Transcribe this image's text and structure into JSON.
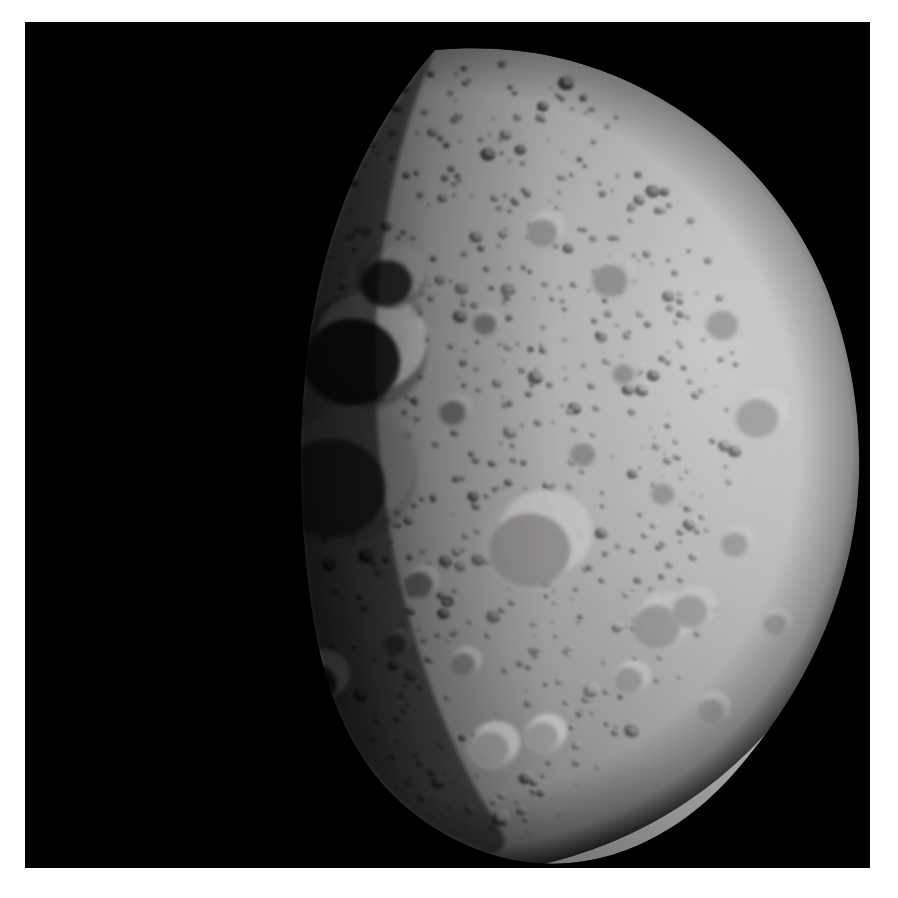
{
  "image": {
    "subject_name": "4 Vesta",
    "subject_type": "asteroid",
    "view": "half-lit disc, terminator on left, illuminated limb on right",
    "palette": {
      "page_background": "#ffffff",
      "space_background": "#000000",
      "limb_highlight": "#eceaea",
      "sunlit_regolith": "#c9c7c6",
      "midtone_regolith": "#9e9c9b",
      "terminator_dim": "#4a4847",
      "shadow": "#070707",
      "crater_floor_dark": "#5d5b5a",
      "crater_rim_bright": "#e2e0df"
    },
    "frame": {
      "x": 25,
      "y": 22,
      "width": 845,
      "height": 846
    }
  },
  "body_shape": {
    "comment": "Outline of the asteroid disc in frame-local coordinates (845x846 viewBox).",
    "outline_path": "M 410 28 C 500 20 580 40 650 85 C 720 130 775 195 805 275 C 828 338 836 400 834 455 C 832 510 820 560 800 608 C 778 660 748 706 712 748 C 676 790 634 818 590 832 C 548 845 505 845 465 832 C 428 820 396 800 370 775 C 346 752 330 726 318 700 C 300 660 290 616 284 568 C 276 505 274 440 278 378 C 282 312 294 248 316 188 C 336 134 368 76 410 28 Z",
    "terminator_path": "M 410 28 C 392 70 376 118 366 170 C 352 244 348 320 352 396 C 356 470 368 542 388 610 C 404 666 426 722 454 772 C 474 808 494 824 465 832 C 428 820 396 800 370 775 C 346 752 330 726 318 700 C 300 660 290 616 284 568 C 276 505 274 440 278 378 C 282 312 294 248 316 188 C 336 134 368 76 410 28 Z"
  },
  "lighting": {
    "sun_direction": "from upper right",
    "terminator_x_fraction": 0.42,
    "limb_brightness": 0.93,
    "shadow_darkness": 0.03
  },
  "craters": [
    {
      "cx": 512,
      "cy": 520,
      "r": 46,
      "tone": 0.7,
      "rim": 0.95,
      "name": "central-large-crater"
    },
    {
      "cx": 336,
      "cy": 330,
      "r": 54,
      "tone": 0.05,
      "rim": 1.0,
      "name": "bright-rim-shadow-crater"
    },
    {
      "cx": 316,
      "cy": 455,
      "r": 62,
      "tone": 0.22,
      "rim": 0.5,
      "name": "terminator-basin"
    },
    {
      "cx": 366,
      "cy": 256,
      "r": 29,
      "tone": 0.14,
      "rim": 0.72,
      "name": "upper-left-crater"
    },
    {
      "cx": 292,
      "cy": 658,
      "r": 27,
      "tone": 0.06,
      "rim": 0.96,
      "name": "crescent-rim-crater"
    },
    {
      "cx": 636,
      "cy": 600,
      "r": 27,
      "tone": 0.74,
      "rim": 0.92,
      "name": "right-paired-crater-a"
    },
    {
      "cx": 668,
      "cy": 586,
      "r": 20,
      "tone": 0.76,
      "rim": 0.9,
      "name": "right-paired-crater-b"
    },
    {
      "cx": 736,
      "cy": 392,
      "r": 24,
      "tone": 0.78,
      "rim": 0.94,
      "name": "right-limb-crater"
    },
    {
      "cx": 700,
      "cy": 300,
      "r": 18,
      "tone": 0.76,
      "rim": 0.92,
      "name": "upper-right-crater"
    },
    {
      "cx": 588,
      "cy": 255,
      "r": 20,
      "tone": 0.72,
      "rim": 0.9,
      "name": "north-crater-a"
    },
    {
      "cx": 520,
      "cy": 208,
      "r": 17,
      "tone": 0.7,
      "rim": 0.9,
      "name": "north-crater-b"
    },
    {
      "cx": 468,
      "cy": 724,
      "r": 22,
      "tone": 0.76,
      "rim": 0.93,
      "name": "south-crater-a"
    },
    {
      "cx": 520,
      "cy": 712,
      "r": 18,
      "tone": 0.78,
      "rim": 0.94,
      "name": "south-crater-b"
    },
    {
      "cx": 606,
      "cy": 656,
      "r": 16,
      "tone": 0.74,
      "rim": 0.9,
      "name": "south-crater-c"
    },
    {
      "cx": 688,
      "cy": 686,
      "r": 15,
      "tone": 0.72,
      "rim": 0.88,
      "name": "south-crater-d"
    },
    {
      "cx": 430,
      "cy": 388,
      "r": 15,
      "tone": 0.48,
      "rim": 0.8,
      "name": "mid-crater-a"
    },
    {
      "cx": 462,
      "cy": 300,
      "r": 13,
      "tone": 0.52,
      "rim": 0.82,
      "name": "mid-crater-b"
    },
    {
      "cx": 560,
      "cy": 430,
      "r": 14,
      "tone": 0.66,
      "rim": 0.86,
      "name": "mid-crater-c"
    },
    {
      "cx": 640,
      "cy": 470,
      "r": 13,
      "tone": 0.7,
      "rim": 0.88,
      "name": "mid-crater-d"
    },
    {
      "cx": 712,
      "cy": 520,
      "r": 15,
      "tone": 0.72,
      "rim": 0.9,
      "name": "mid-crater-e"
    },
    {
      "cx": 752,
      "cy": 600,
      "r": 13,
      "tone": 0.7,
      "rim": 0.88,
      "name": "mid-crater-f"
    },
    {
      "cx": 396,
      "cy": 560,
      "r": 16,
      "tone": 0.4,
      "rim": 0.74,
      "name": "mid-crater-g"
    },
    {
      "cx": 372,
      "cy": 620,
      "r": 13,
      "tone": 0.34,
      "rim": 0.7,
      "name": "mid-crater-h"
    },
    {
      "cx": 440,
      "cy": 640,
      "r": 14,
      "tone": 0.55,
      "rim": 0.82,
      "name": "mid-crater-i"
    },
    {
      "cx": 600,
      "cy": 350,
      "r": 12,
      "tone": 0.7,
      "rim": 0.88,
      "name": "mid-crater-j"
    }
  ],
  "texture": {
    "speckle_count": 900,
    "seed": 20110801,
    "min_radius": 1.4,
    "max_radius": 9.0
  },
  "accessibility": {
    "alt_text": "Grayscale spacecraft photograph of the asteroid Vesta showing a heavily cratered, roughly spherical body lit from the upper right against black space."
  }
}
